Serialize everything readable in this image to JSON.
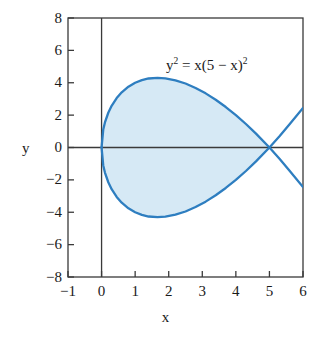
{
  "figure": {
    "equation_label": "y2 = x(5 − x)2",
    "equation_parts": {
      "lhs_base": "y",
      "lhs_exp": "2",
      "eq": " = x(5 − x)",
      "rhs_exp": "2"
    },
    "axis_label_x": "x",
    "axis_label_y": "y"
  },
  "colors": {
    "curve": "#2e7ec0",
    "fill": "#d6e9f5",
    "axis": "#3a3a3a",
    "frame": "#3a3a3a",
    "text": "#1a1a1a",
    "background": "#ffffff"
  },
  "chart_data": {
    "type": "line",
    "title": "",
    "subtitle": "",
    "xlabel": "x",
    "ylabel": "y",
    "xlim": [
      -1,
      6
    ],
    "ylim": [
      -8,
      8
    ],
    "xticks": [
      -1,
      0,
      1,
      2,
      3,
      4,
      5,
      6
    ],
    "xtick_labels": [
      "−1",
      "0",
      "1",
      "2",
      "3",
      "4",
      "5",
      "6"
    ],
    "yticks": [
      -8,
      -6,
      -4,
      -2,
      0,
      2,
      4,
      6,
      8
    ],
    "ytick_labels": [
      "−8",
      "−6",
      "−4",
      "−2",
      "0",
      "2",
      "4",
      "6",
      "8"
    ],
    "grid": false,
    "legend": null,
    "annotations": [
      {
        "text": "y2 = x(5 − x)2",
        "x": 2.55,
        "y": 5.6
      }
    ],
    "series": [
      {
        "name": "y = +sqrt(x)(5 - x)",
        "comment": "upper branch of y^2 = x(5-x)^2 for 0 <= x <= 6",
        "x": [
          0,
          0.05,
          0.1,
          0.2,
          0.3,
          0.45,
          0.6,
          0.8,
          1.0,
          1.2,
          1.4,
          1.6667,
          1.9,
          2.2,
          2.5,
          2.8,
          3.1,
          3.4,
          3.7,
          4.0,
          4.3,
          4.6,
          5.0,
          5.3,
          5.6,
          6.0
        ],
        "y": [
          0,
          1.106,
          1.549,
          2.147,
          2.575,
          3.053,
          3.408,
          3.758,
          4.0,
          4.162,
          4.264,
          4.303,
          4.273,
          4.152,
          3.953,
          3.679,
          3.345,
          2.95,
          2.5,
          2.0,
          1.451,
          0.858,
          0,
          -0.691,
          -1.434,
          -2.449
        ],
        "marker": "none",
        "linewidth": 2.2,
        "color": "#2e7ec0"
      },
      {
        "name": "y = -sqrt(x)(5 - x)",
        "comment": "lower branch, mirror of upper about y = 0",
        "x": [
          0,
          0.05,
          0.1,
          0.2,
          0.3,
          0.45,
          0.6,
          0.8,
          1.0,
          1.2,
          1.4,
          1.6667,
          1.9,
          2.2,
          2.5,
          2.8,
          3.1,
          3.4,
          3.7,
          4.0,
          4.3,
          4.6,
          5.0,
          5.3,
          5.6,
          6.0
        ],
        "y": [
          0,
          -1.106,
          -1.549,
          -2.147,
          -2.575,
          -3.053,
          -3.408,
          -3.758,
          -4.0,
          -4.162,
          -4.264,
          -4.303,
          -4.273,
          -4.152,
          -3.953,
          -3.679,
          -3.345,
          -2.95,
          -2.5,
          -2.0,
          -1.451,
          -0.858,
          0,
          0.691,
          1.434,
          2.449
        ],
        "marker": "none",
        "linewidth": 2.2,
        "color": "#2e7ec0"
      }
    ],
    "shaded_region": {
      "label": "loop interior",
      "x_range": [
        0,
        5
      ],
      "fill": "#d6e9f5",
      "description": "Region enclosed by the loop of the curve between x = 0 and x = 5"
    },
    "key_points": [
      {
        "label": "origin / node",
        "x": 0,
        "y": 0
      },
      {
        "label": "self-intersection",
        "x": 5,
        "y": 0
      },
      {
        "label": "loop maximum",
        "x": 1.6667,
        "y": 4.303
      },
      {
        "label": "loop minimum",
        "x": 1.6667,
        "y": -4.303
      }
    ]
  }
}
